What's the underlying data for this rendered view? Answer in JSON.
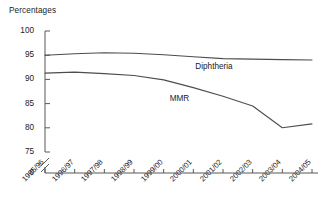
{
  "chart_data": {
    "type": "line",
    "title": "",
    "ylabel": "Percentages",
    "xlabel": "",
    "categories": [
      "1995/96",
      "1996/97",
      "1997/98",
      "1998/99",
      "1999/00",
      "2000/01",
      "2001/02",
      "2002/03",
      "2003/04",
      "2004/05"
    ],
    "ylim": [
      75,
      100
    ],
    "yticks": [
      "100",
      "95",
      "90",
      "85",
      "80",
      "75",
      "0"
    ],
    "ytick_values": [
      100,
      95,
      90,
      85,
      80,
      75,
      0
    ],
    "axis_break": true,
    "axis_break_symbol": "//",
    "grid": false,
    "legend": "inline-labels",
    "series": [
      {
        "name": "Diphtheria",
        "label_position": "inline-right-above",
        "color": "#4d4d4d",
        "values": [
          95.0,
          95.3,
          95.5,
          95.4,
          95.1,
          94.7,
          94.3,
          94.2,
          94.1,
          94.0
        ]
      },
      {
        "name": "MMR",
        "label_position": "inline-right-below",
        "color": "#4d4d4d",
        "values": [
          91.3,
          91.5,
          91.2,
          90.8,
          89.9,
          88.3,
          86.5,
          84.5,
          80.0,
          80.8
        ]
      }
    ]
  },
  "labels": {
    "diphtheria": "Diphtheria",
    "mmr": "MMR"
  },
  "colors": {
    "axis": "#595959",
    "line": "#4d4d4d",
    "text": "#1a1a1a"
  }
}
